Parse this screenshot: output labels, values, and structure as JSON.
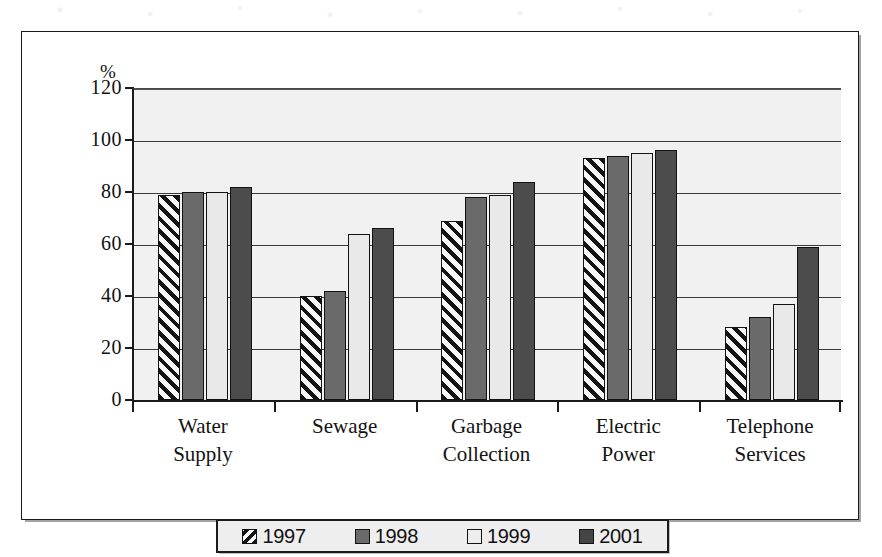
{
  "chart_data": {
    "type": "bar",
    "title": "",
    "xlabel": "",
    "ylabel": "%",
    "ylim": [
      0,
      120
    ],
    "yticks": [
      0,
      20,
      40,
      60,
      80,
      100,
      120
    ],
    "ytick_labels": [
      "0",
      "20",
      "40",
      "60",
      "80",
      "100",
      "120"
    ],
    "grid": true,
    "grid_axis": "y",
    "legend_position": "bottom",
    "categories": [
      "Water Supply",
      "Sewage",
      "Garbage Collection",
      "Electric Power",
      "Telephone Services"
    ],
    "category_lines": [
      [
        "Water",
        "Supply"
      ],
      [
        "Sewage",
        ""
      ],
      [
        "Garbage",
        "Collection"
      ],
      [
        "Electric",
        "Power"
      ],
      [
        "Telephone",
        "Services"
      ]
    ],
    "series": [
      {
        "name": "1997",
        "style": "hatched-diagonal",
        "color": "#f2f2f2",
        "values": [
          79,
          40,
          69,
          93,
          28
        ]
      },
      {
        "name": "1998",
        "style": "solid",
        "color": "#6a6a6a",
        "values": [
          80,
          42,
          78,
          94,
          32
        ]
      },
      {
        "name": "1999",
        "style": "solid",
        "color": "#e9e9e9",
        "values": [
          80,
          64,
          79,
          95,
          37
        ]
      },
      {
        "name": "2001",
        "style": "solid",
        "color": "#4c4c4c",
        "values": [
          82,
          66,
          84,
          96,
          59
        ]
      }
    ]
  },
  "axis": {
    "unit_label": "%"
  },
  "legend": {
    "items": [
      {
        "label": "1997",
        "swatch": "hatched-swatch"
      },
      {
        "label": "1998",
        "swatch": "gray-swatch"
      },
      {
        "label": "1999",
        "swatch": "white-swatch"
      },
      {
        "label": "2001",
        "swatch": "dark-gray-swatch"
      }
    ]
  }
}
